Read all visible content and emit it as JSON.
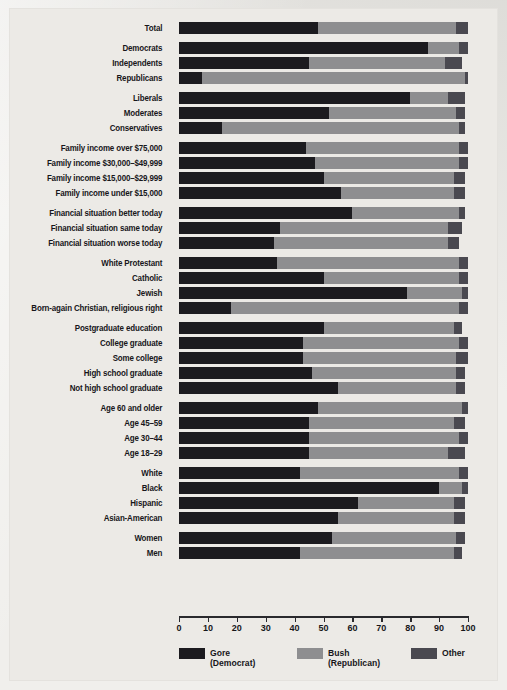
{
  "chart_data": {
    "type": "bar",
    "orientation": "horizontal",
    "stacked": true,
    "title": "",
    "xlabel": "",
    "ylabel": "",
    "xlim": [
      0,
      100
    ],
    "grid": false,
    "legend_position": "bottom",
    "legend": [
      {
        "name": "Gore",
        "sub": "(Democrat)",
        "color": "#1c1b1f"
      },
      {
        "name": "Bush",
        "sub": "(Republican)",
        "color": "#8e8e90"
      },
      {
        "name": "Other",
        "sub": "",
        "color": "#4a4950"
      }
    ],
    "series": [
      {
        "name": "Gore",
        "key": "gore"
      },
      {
        "name": "Bush",
        "key": "bush"
      },
      {
        "name": "Other",
        "key": "other"
      }
    ],
    "xticks": [
      0,
      10,
      20,
      30,
      40,
      50,
      60,
      70,
      80,
      90,
      100
    ],
    "groups": [
      {
        "name": "total",
        "rows": [
          {
            "label": "Total",
            "gore": 48,
            "bush": 48,
            "other": 4
          }
        ]
      },
      {
        "name": "party",
        "rows": [
          {
            "label": "Democrats",
            "gore": 86,
            "bush": 11,
            "other": 3
          },
          {
            "label": "Independents",
            "gore": 45,
            "bush": 47,
            "other": 6
          },
          {
            "label": "Republicans",
            "gore": 8,
            "bush": 91,
            "other": 1
          }
        ]
      },
      {
        "name": "ideology",
        "rows": [
          {
            "label": "Liberals",
            "gore": 80,
            "bush": 13,
            "other": 6
          },
          {
            "label": "Moderates",
            "gore": 52,
            "bush": 44,
            "other": 3
          },
          {
            "label": "Conservatives",
            "gore": 15,
            "bush": 82,
            "other": 2
          }
        ]
      },
      {
        "name": "family-income",
        "rows": [
          {
            "label": "Family income over $75,000",
            "gore": 44,
            "bush": 53,
            "other": 3
          },
          {
            "label": "Family income $30,000–$49,999",
            "gore": 47,
            "bush": 50,
            "other": 3
          },
          {
            "label": "Family income $15,000–$29,999",
            "gore": 50,
            "bush": 45,
            "other": 4
          },
          {
            "label": "Family income under $15,000",
            "gore": 56,
            "bush": 39,
            "other": 4
          }
        ]
      },
      {
        "name": "financial-situation",
        "rows": [
          {
            "label": "Financial situation better today",
            "gore": 60,
            "bush": 37,
            "other": 2
          },
          {
            "label": "Financial situation same today",
            "gore": 35,
            "bush": 58,
            "other": 5
          },
          {
            "label": "Financial situation worse today",
            "gore": 33,
            "bush": 60,
            "other": 4
          }
        ]
      },
      {
        "name": "religion",
        "rows": [
          {
            "label": "White Protestant",
            "gore": 34,
            "bush": 63,
            "other": 3
          },
          {
            "label": "Catholic",
            "gore": 50,
            "bush": 47,
            "other": 3
          },
          {
            "label": "Jewish",
            "gore": 79,
            "bush": 19,
            "other": 2
          },
          {
            "label": "Born-again Christian, religious right",
            "gore": 18,
            "bush": 79,
            "other": 3
          }
        ]
      },
      {
        "name": "education",
        "rows": [
          {
            "label": "Postgraduate education",
            "gore": 50,
            "bush": 45,
            "other": 3
          },
          {
            "label": "College graduate",
            "gore": 43,
            "bush": 54,
            "other": 3
          },
          {
            "label": "Some college",
            "gore": 43,
            "bush": 53,
            "other": 4
          },
          {
            "label": "High school graduate",
            "gore": 46,
            "bush": 50,
            "other": 3
          },
          {
            "label": "Not high school graduate",
            "gore": 55,
            "bush": 41,
            "other": 3
          }
        ]
      },
      {
        "name": "age",
        "rows": [
          {
            "label": "Age 60 and older",
            "gore": 48,
            "bush": 50,
            "other": 2
          },
          {
            "label": "Age 45–59",
            "gore": 45,
            "bush": 50,
            "other": 4
          },
          {
            "label": "Age 30–44",
            "gore": 45,
            "bush": 52,
            "other": 3
          },
          {
            "label": "Age 18–29",
            "gore": 45,
            "bush": 48,
            "other": 6
          }
        ]
      },
      {
        "name": "race",
        "rows": [
          {
            "label": "White",
            "gore": 42,
            "bush": 55,
            "other": 3
          },
          {
            "label": "Black",
            "gore": 90,
            "bush": 8,
            "other": 2
          },
          {
            "label": "Hispanic",
            "gore": 62,
            "bush": 33,
            "other": 4
          },
          {
            "label": "Asian-American",
            "gore": 55,
            "bush": 40,
            "other": 4
          }
        ]
      },
      {
        "name": "gender",
        "rows": [
          {
            "label": "Women",
            "gore": 53,
            "bush": 43,
            "other": 3
          },
          {
            "label": "Men",
            "gore": 42,
            "bush": 53,
            "other": 3
          }
        ]
      }
    ]
  },
  "colors": {
    "gore": "#1c1b1f",
    "bush": "#8e8e90",
    "other": "#4a4950",
    "background": "#eceae6",
    "text": "#17161a"
  }
}
